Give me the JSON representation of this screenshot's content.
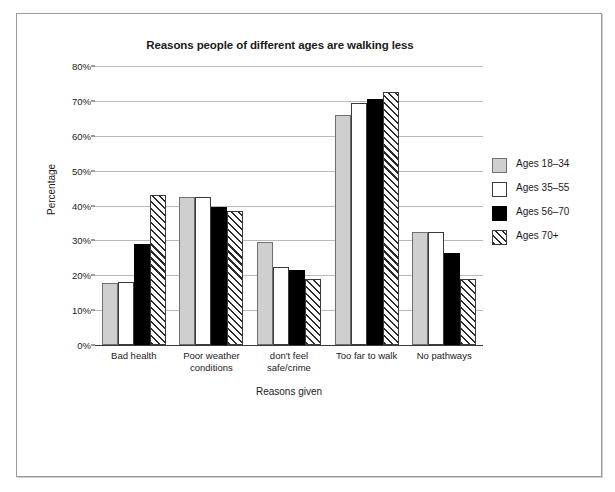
{
  "page": {
    "top_caption_fragment": "",
    "background_color": "#ffffff",
    "frame_color": "#9a9a9a"
  },
  "chart_data": {
    "type": "bar",
    "title": "Reasons people of different ages are walking less",
    "xlabel": "Reasons given",
    "ylabel": "Percentage",
    "ylim": [
      0,
      80
    ],
    "ytick_labels": [
      "0%",
      "10%",
      "20%",
      "30%",
      "40%",
      "50%",
      "60%",
      "70%",
      "80%"
    ],
    "ytick_values": [
      0,
      10,
      20,
      30,
      40,
      50,
      60,
      70,
      80
    ],
    "grid": true,
    "legend_position": "right",
    "categories": [
      "Bad health",
      "Poor weather conditions",
      "don't feel safe/crime",
      "Too far to walk",
      "No pathways"
    ],
    "category_lines": [
      [
        "Bad health"
      ],
      [
        "Poor weather",
        "conditions"
      ],
      [
        "don't feel",
        "safe/crime"
      ],
      [
        "Too far to walk"
      ],
      [
        "No pathways"
      ]
    ],
    "series": [
      {
        "name": "Ages 18–34",
        "color": "#cfcfcf",
        "fill": "solid-gray",
        "values": [
          17.8,
          42.5,
          29.5,
          66.0,
          32.5
        ]
      },
      {
        "name": "Ages 35–55",
        "color": "#ffffff",
        "fill": "solid-white",
        "values": [
          18.0,
          42.5,
          22.5,
          69.5,
          32.5
        ]
      },
      {
        "name": "Ages 56–70",
        "color": "#000000",
        "fill": "solid-black",
        "values": [
          29.0,
          39.5,
          21.5,
          70.5,
          26.5
        ]
      },
      {
        "name": "Ages 70+",
        "color": "#ffffff",
        "fill": "hatched",
        "values": [
          43.0,
          38.5,
          19.0,
          72.5,
          19.0
        ]
      }
    ]
  },
  "legend": {
    "entries": [
      {
        "label": "Ages 18–34",
        "swatch": "gray-swatch-icon"
      },
      {
        "label": "Ages 35–55",
        "swatch": "white-swatch-icon"
      },
      {
        "label": "Ages 56–70",
        "swatch": "black-swatch-icon"
      },
      {
        "label": "Ages 70+",
        "swatch": "hatched-swatch-icon"
      }
    ]
  }
}
